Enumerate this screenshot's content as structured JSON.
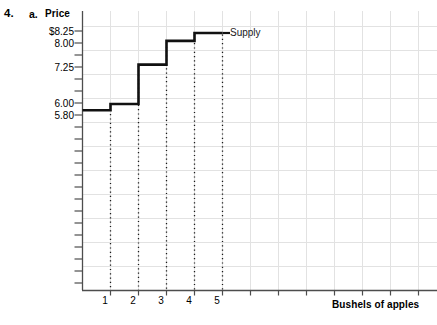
{
  "problem": {
    "number": "4.",
    "part": "a."
  },
  "chart_data": {
    "type": "line",
    "subtype": "step",
    "title": "",
    "ylabel": "Price",
    "xlabel": "Bushels of apples",
    "grid": true,
    "legend_position": "inline-right-of-series-end",
    "series": [
      {
        "name": "Supply",
        "step_type": "post",
        "x": [
          0,
          1,
          2,
          3,
          4,
          5
        ],
        "y": [
          5.8,
          6.0,
          7.25,
          8.0,
          8.25,
          8.25
        ],
        "points": [
          {
            "quantity": 1,
            "price": 6.0
          },
          {
            "quantity": 2,
            "price": 7.25
          },
          {
            "quantity": 3,
            "price": 8.0
          },
          {
            "quantity": 4,
            "price": 8.25
          },
          {
            "quantity": 5,
            "price": 8.25
          }
        ],
        "color": "#111111"
      }
    ],
    "y_tick_labels": [
      "$8.25",
      "8.00",
      "7.25",
      "6.00",
      "5.80"
    ],
    "y_tick_values": [
      8.25,
      8.0,
      7.25,
      6.0,
      5.8
    ],
    "x_tick_labels": [
      "1",
      "2",
      "3",
      "4",
      "5"
    ],
    "x_tick_values": [
      1,
      2,
      3,
      4,
      5
    ],
    "xlim": [
      0,
      13
    ],
    "ylim": [
      0,
      9.0
    ],
    "dropline_style": "dotted",
    "dropline_quantities": [
      1,
      2,
      3,
      4,
      5
    ],
    "colors": {
      "axis": "#4d4d4d",
      "grid": "#e2e2e2",
      "series": "#111111",
      "text": "#000000"
    }
  }
}
